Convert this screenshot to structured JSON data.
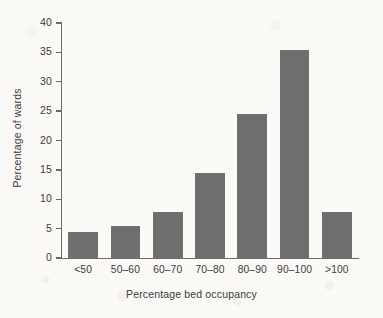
{
  "chart_data": {
    "type": "bar",
    "title": "",
    "subtitle": "",
    "xlabel": "Percentage bed occupancy",
    "ylabel": "Percentage of wards",
    "categories": [
      "<50",
      "50–60",
      "60–70",
      "70–80",
      "80–90",
      "90–100",
      ">100"
    ],
    "values": [
      4.5,
      5.4,
      7.8,
      14.4,
      24.5,
      35.4,
      7.9
    ],
    "ylim": [
      0,
      40
    ],
    "ytick_labels": [
      "0",
      "5",
      "10",
      "15",
      "20",
      "25",
      "30",
      "35",
      "40"
    ],
    "ytick_values": [
      0,
      5,
      10,
      15,
      20,
      25,
      30,
      35,
      40
    ],
    "grid": false,
    "legend": false,
    "legend_position": "none",
    "bar_color": "#6e6e6e",
    "axis_color": "#6b6b6b",
    "background_color": "#fbfaf7"
  }
}
